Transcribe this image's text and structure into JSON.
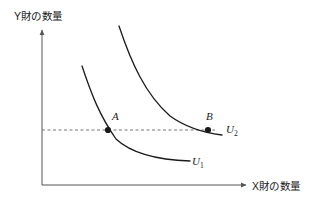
{
  "figure": {
    "type": "indifference-curve-diagram",
    "background_color": "#ffffff",
    "line_color": "#1a1a1a",
    "axis_color": "#555555",
    "dashed_color": "#777777"
  },
  "axes": {
    "y_label": "Y財の数量",
    "x_label": "X財の数量",
    "origin": {
      "x": 42,
      "y": 185
    },
    "y_top": 28,
    "x_right": 248
  },
  "points": [
    {
      "name": "A",
      "label": "A",
      "x": 108,
      "y": 130
    },
    {
      "name": "B",
      "label": "B",
      "x": 208,
      "y": 130
    }
  ],
  "curves": [
    {
      "name": "U1",
      "label": "U",
      "subscript": "1",
      "path": "M 82 66 C 92 96, 100 116, 116 139 C 132 154, 160 160, 190 161"
    },
    {
      "name": "U2",
      "label": "U",
      "subscript": "2",
      "path": "M 119 26 C 131 62, 145 94, 170 116 C 188 129, 206 133, 222 135"
    }
  ],
  "guide_line": {
    "name": "horizontal-dashed-utility-line",
    "y": 130,
    "x_start": 42,
    "x_end": 215,
    "style": "dashed"
  },
  "chart_data": {
    "type": "line",
    "title": "",
    "xlabel": "X財の数量",
    "ylabel": "Y財の数量",
    "grid": false,
    "legend_position": "inline-right",
    "series": [
      {
        "name": "U1",
        "points": [
          [
            82,
            66
          ],
          [
            116,
            139
          ],
          [
            190,
            161
          ]
        ]
      },
      {
        "name": "U2",
        "points": [
          [
            119,
            26
          ],
          [
            170,
            116
          ],
          [
            222,
            135
          ]
        ]
      }
    ],
    "annotations": [
      {
        "label": "A",
        "series": "U1",
        "x": 108,
        "y": 130
      },
      {
        "label": "B",
        "series": "U2",
        "x": 208,
        "y": 130
      }
    ]
  }
}
